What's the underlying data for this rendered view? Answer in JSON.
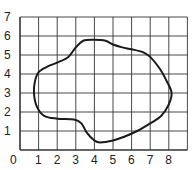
{
  "diagram": {
    "type": "grid-with-closed-curve",
    "x_ticks": [
      "0",
      "1",
      "2",
      "3",
      "4",
      "5",
      "6",
      "7",
      "8"
    ],
    "y_ticks": [
      "1",
      "2",
      "3",
      "4",
      "5",
      "6",
      "7"
    ],
    "grid": {
      "x_min": 0,
      "x_max": 9,
      "y_min": 0,
      "y_max": 7
    },
    "curve_points": [
      [
        1.0,
        4.1
      ],
      [
        1.5,
        4.4
      ],
      [
        2.0,
        4.6
      ],
      [
        2.6,
        4.9
      ],
      [
        3.0,
        5.4
      ],
      [
        3.4,
        5.75
      ],
      [
        4.0,
        5.8
      ],
      [
        4.6,
        5.75
      ],
      [
        5.0,
        5.55
      ],
      [
        5.5,
        5.4
      ],
      [
        6.0,
        5.3
      ],
      [
        6.6,
        5.15
      ],
      [
        7.0,
        4.9
      ],
      [
        7.5,
        4.3
      ],
      [
        7.9,
        3.6
      ],
      [
        8.15,
        3.0
      ],
      [
        8.0,
        2.4
      ],
      [
        7.6,
        1.8
      ],
      [
        7.0,
        1.4
      ],
      [
        6.3,
        1.0
      ],
      [
        5.6,
        0.7
      ],
      [
        5.0,
        0.5
      ],
      [
        4.3,
        0.4
      ],
      [
        4.0,
        0.5
      ],
      [
        3.6,
        0.9
      ],
      [
        3.3,
        1.4
      ],
      [
        2.9,
        1.6
      ],
      [
        2.0,
        1.65
      ],
      [
        1.3,
        1.8
      ],
      [
        0.9,
        2.3
      ],
      [
        0.75,
        3.0
      ],
      [
        0.8,
        3.6
      ]
    ],
    "colors": {
      "grid": "#333333",
      "curve": "#1a1a1a"
    }
  }
}
